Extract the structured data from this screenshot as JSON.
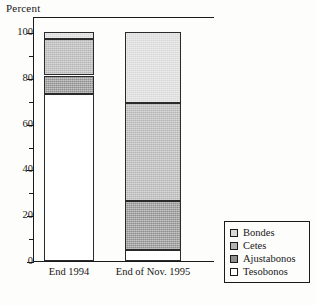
{
  "chart_data": {
    "type": "bar",
    "subtype": "stacked-100-percent",
    "title": "",
    "xlabel": "",
    "ylabel": "Percent",
    "ylim": [
      0,
      100
    ],
    "ytick_labels": [
      "0",
      "20",
      "40",
      "60",
      "80",
      "100"
    ],
    "ytick_values": [
      0,
      20,
      40,
      60,
      80,
      100
    ],
    "yminor_values": [
      10,
      30,
      50,
      70,
      90
    ],
    "grid": false,
    "legend_position": "right-bottom",
    "categories": [
      "End 1994",
      "End of Nov. 1995"
    ],
    "series": [
      {
        "name": "Bondes",
        "values": [
          3,
          31
        ],
        "color": "#d9d9d9"
      },
      {
        "name": "Cetes",
        "values": [
          16,
          43
        ],
        "color": "#b4b4b4"
      },
      {
        "name": "Ajustabonos",
        "values": [
          8,
          21
        ],
        "color": "#8e8e8e"
      },
      {
        "name": "Tesobonos",
        "values": [
          73,
          5
        ],
        "color": "#ffffff"
      }
    ],
    "stack_order_top_to_bottom": [
      "Bondes",
      "Cetes",
      "Ajustabonos",
      "Tesobonos"
    ]
  },
  "axis": {
    "y_title": "Percent",
    "ticks": [
      {
        "label": "100",
        "value": 100
      },
      {
        "label": "80",
        "value": 80
      },
      {
        "label": "60",
        "value": 60
      },
      {
        "label": "40",
        "value": 40
      },
      {
        "label": "20",
        "value": 20
      },
      {
        "label": "0",
        "value": 0
      }
    ]
  },
  "xaxis": {
    "labels": [
      "End 1994",
      "End of Nov. 1995"
    ]
  },
  "legend": {
    "items": [
      {
        "label": "Bondes"
      },
      {
        "label": "Cetes"
      },
      {
        "label": "Ajustabonos"
      },
      {
        "label": "Tesobonos"
      }
    ]
  }
}
